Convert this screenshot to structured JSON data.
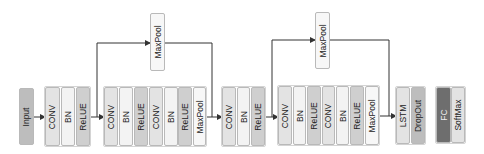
{
  "diagram": {
    "type": "neural-network-architecture",
    "colors": {
      "input": "#bdbdbd",
      "conv": "#e3e3e3",
      "bn": "#f3f3f3",
      "relue": "#cfcfcf",
      "maxpool": "#f7f7f7",
      "lstm": "#e3e3e3",
      "dropout": "#bdbdbd",
      "fc": "#6e6e6e",
      "softmax": "#e3e3e3",
      "line": "#333333"
    },
    "nodes": [
      {
        "id": "input",
        "label": "Input",
        "x": 19,
        "y": 88,
        "w": 15,
        "h": 57,
        "color": "input"
      },
      {
        "id": "g1-conv",
        "label": "CONV",
        "x": 45,
        "y": 87,
        "w": 15,
        "h": 59,
        "color": "conv"
      },
      {
        "id": "g1-bn",
        "label": "BN",
        "x": 61,
        "y": 87,
        "w": 14,
        "h": 59,
        "color": "bn"
      },
      {
        "id": "g1-relue",
        "label": "ReLUE",
        "x": 76,
        "y": 87,
        "w": 14,
        "h": 59,
        "color": "relue"
      },
      {
        "id": "g2-conv1",
        "label": "CONV",
        "x": 104,
        "y": 87,
        "w": 14,
        "h": 59,
        "color": "conv"
      },
      {
        "id": "g2-bn1",
        "label": "BN",
        "x": 119,
        "y": 87,
        "w": 14,
        "h": 59,
        "color": "bn"
      },
      {
        "id": "g2-relue1",
        "label": "ReLUE",
        "x": 134,
        "y": 87,
        "w": 14,
        "h": 59,
        "color": "relue"
      },
      {
        "id": "g2-conv2",
        "label": "CONV",
        "x": 149,
        "y": 87,
        "w": 14,
        "h": 59,
        "color": "conv"
      },
      {
        "id": "g2-bn2",
        "label": "BN",
        "x": 164,
        "y": 87,
        "w": 14,
        "h": 59,
        "color": "bn"
      },
      {
        "id": "g2-relue2",
        "label": "ReLUE",
        "x": 178,
        "y": 87,
        "w": 14,
        "h": 59,
        "color": "relue"
      },
      {
        "id": "g2-maxpool",
        "label": "MaxPool",
        "x": 193,
        "y": 87,
        "w": 13,
        "h": 59,
        "color": "maxpool"
      },
      {
        "id": "skip1-maxpool",
        "label": "MaxPool",
        "x": 150,
        "y": 13,
        "w": 15,
        "h": 58,
        "color": "maxpool"
      },
      {
        "id": "g3-conv",
        "label": "CONV",
        "x": 222,
        "y": 87,
        "w": 14,
        "h": 59,
        "color": "conv"
      },
      {
        "id": "g3-bn",
        "label": "BN",
        "x": 237,
        "y": 87,
        "w": 13,
        "h": 59,
        "color": "bn"
      },
      {
        "id": "g3-relue",
        "label": "ReLUE",
        "x": 251,
        "y": 87,
        "w": 14,
        "h": 59,
        "color": "relue"
      },
      {
        "id": "g4-conv1",
        "label": "CONV",
        "x": 278,
        "y": 86,
        "w": 14,
        "h": 59,
        "color": "conv"
      },
      {
        "id": "g4-bn1",
        "label": "BN",
        "x": 293,
        "y": 86,
        "w": 13,
        "h": 59,
        "color": "bn"
      },
      {
        "id": "g4-relue1",
        "label": "ReLUE",
        "x": 307,
        "y": 86,
        "w": 14,
        "h": 59,
        "color": "relue"
      },
      {
        "id": "g4-conv2",
        "label": "CONV",
        "x": 322,
        "y": 86,
        "w": 13,
        "h": 59,
        "color": "conv"
      },
      {
        "id": "g4-bn2",
        "label": "BN",
        "x": 336,
        "y": 86,
        "w": 13,
        "h": 59,
        "color": "bn"
      },
      {
        "id": "g4-relue2",
        "label": "ReLUE",
        "x": 350,
        "y": 86,
        "w": 14,
        "h": 59,
        "color": "relue"
      },
      {
        "id": "g4-maxpool",
        "label": "MaxPool",
        "x": 365,
        "y": 86,
        "w": 14,
        "h": 59,
        "color": "maxpool"
      },
      {
        "id": "skip2-maxpool",
        "label": "MaxPool",
        "x": 315,
        "y": 12,
        "w": 15,
        "h": 57,
        "color": "maxpool"
      },
      {
        "id": "lstm",
        "label": "LSTM",
        "x": 396,
        "y": 87,
        "w": 14,
        "h": 57,
        "color": "lstm"
      },
      {
        "id": "dropout",
        "label": "DropOut",
        "x": 411,
        "y": 87,
        "w": 14,
        "h": 57,
        "color": "dropout"
      },
      {
        "id": "fc",
        "label": "FC",
        "x": 436,
        "y": 87,
        "w": 15,
        "h": 56,
        "color": "fc",
        "dark": true
      },
      {
        "id": "softmax",
        "label": "SoftMax",
        "x": 451,
        "y": 87,
        "w": 14,
        "h": 56,
        "color": "softmax"
      }
    ],
    "groups": [
      {
        "id": "group1",
        "x": 44,
        "y": 86,
        "w": 47,
        "h": 61
      },
      {
        "id": "group2",
        "x": 103,
        "y": 86,
        "w": 104,
        "h": 61
      },
      {
        "id": "group3",
        "x": 221,
        "y": 86,
        "w": 45,
        "h": 61
      },
      {
        "id": "group4",
        "x": 277,
        "y": 85,
        "w": 103,
        "h": 61
      },
      {
        "id": "group5",
        "x": 395,
        "y": 86,
        "w": 31,
        "h": 59
      },
      {
        "id": "group6",
        "x": 435,
        "y": 86,
        "w": 31,
        "h": 58
      }
    ],
    "edges": [
      {
        "from": "input",
        "to": "g1-conv",
        "points": [
          [
            34,
            117
          ],
          [
            45,
            117
          ]
        ],
        "arrow": true
      },
      {
        "from": "g1-relue",
        "to": "g2-conv1",
        "points": [
          [
            90,
            117
          ],
          [
            104,
            117
          ]
        ],
        "arrow": true
      },
      {
        "from": "g1-relue",
        "to": "skip1-maxpool",
        "points": [
          [
            97,
            117
          ],
          [
            97,
            43
          ],
          [
            150,
            43
          ]
        ],
        "arrow": true
      },
      {
        "from": "skip1-maxpool",
        "to": "g3-conv",
        "points": [
          [
            165,
            43
          ],
          [
            212,
            43
          ],
          [
            212,
            117
          ]
        ],
        "arrow": false
      },
      {
        "from": "g2-maxpool",
        "to": "g3-conv",
        "points": [
          [
            206,
            117
          ],
          [
            222,
            117
          ]
        ],
        "arrow": true
      },
      {
        "from": "g3-relue",
        "to": "g4-conv1",
        "points": [
          [
            265,
            117
          ],
          [
            278,
            117
          ]
        ],
        "arrow": true
      },
      {
        "from": "g3-relue",
        "to": "skip2-maxpool",
        "points": [
          [
            272,
            117
          ],
          [
            272,
            40
          ],
          [
            315,
            40
          ]
        ],
        "arrow": true
      },
      {
        "from": "skip2-maxpool",
        "to": "lstm",
        "points": [
          [
            330,
            40
          ],
          [
            389,
            40
          ],
          [
            389,
            116
          ]
        ],
        "arrow": false
      },
      {
        "from": "g4-maxpool",
        "to": "lstm",
        "points": [
          [
            379,
            116
          ],
          [
            396,
            116
          ]
        ],
        "arrow": true
      }
    ]
  }
}
